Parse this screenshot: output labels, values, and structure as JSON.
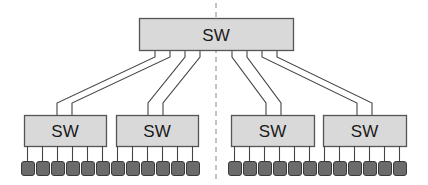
{
  "diagram": {
    "type": "network-topology",
    "colors": {
      "switch_fill": "#d9d9d9",
      "switch_border": "#555555",
      "link": "#444444",
      "device_fill": "#6b6b6b",
      "device_border": "#3a3a3a",
      "divider": "#888888",
      "label": "#1a1a1a"
    },
    "divider": {
      "x": 216,
      "y1": 3,
      "y2": 181,
      "style": "dashed"
    },
    "core_switch": {
      "label": "SW",
      "x": 139,
      "y": 18,
      "w": 154,
      "h": 32,
      "ports_x": [
        155,
        170,
        185,
        200,
        232,
        247,
        262,
        277
      ]
    },
    "edge_switches": [
      {
        "id": "sw-1",
        "label": "SW",
        "x": 24,
        "y": 115,
        "w": 82,
        "h": 31,
        "uplink_x": [
          57,
          72
        ],
        "device_start_x": 21
      },
      {
        "id": "sw-2",
        "label": "SW",
        "x": 116,
        "y": 115,
        "w": 82,
        "h": 31,
        "uplink_x": [
          148,
          163
        ],
        "device_start_x": 111
      },
      {
        "id": "sw-3",
        "label": "SW",
        "x": 231,
        "y": 115,
        "w": 83,
        "h": 31,
        "uplink_x": [
          266,
          281
        ],
        "device_start_x": 228
      },
      {
        "id": "sw-4",
        "label": "SW",
        "x": 323,
        "y": 115,
        "w": 83,
        "h": 31,
        "uplink_x": [
          357,
          372
        ],
        "device_start_x": 318
      }
    ],
    "links": [
      {
        "from_x": 155,
        "to_switch": 0,
        "to_x": 57
      },
      {
        "from_x": 170,
        "to_switch": 0,
        "to_x": 72
      },
      {
        "from_x": 185,
        "to_switch": 1,
        "to_x": 148
      },
      {
        "from_x": 200,
        "to_switch": 1,
        "to_x": 163
      },
      {
        "from_x": 232,
        "to_switch": 2,
        "to_x": 266
      },
      {
        "from_x": 247,
        "to_switch": 2,
        "to_x": 281
      },
      {
        "from_x": 262,
        "to_switch": 3,
        "to_x": 357
      },
      {
        "from_x": 277,
        "to_switch": 3,
        "to_x": 372
      }
    ],
    "devices_per_switch": 6,
    "device": {
      "w": 13,
      "h": 14,
      "y": 161,
      "pitch": 15
    }
  }
}
